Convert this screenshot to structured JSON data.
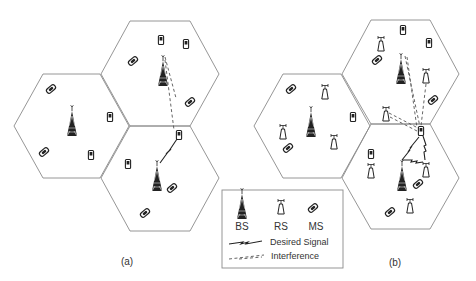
{
  "figure": {
    "panels": [
      {
        "id": "a",
        "label": "(a)",
        "description": "Conventional cellular network: base stations and mobile stations"
      },
      {
        "id": "b",
        "label": "(b)",
        "description": "Relay-assisted cellular network: base stations, relay stations and mobile stations"
      }
    ],
    "legend": {
      "bs_label": "BS",
      "rs_label": "RS",
      "ms_label": "MS",
      "desired_signal_label": "Desired Signal",
      "interference_label": "Interference"
    },
    "icons": {
      "bs": "cell-tower-icon",
      "rs": "relay-station-icon",
      "ms": "mobile-phone-icon"
    },
    "colors": {
      "hex_stroke": "#8a8a8a",
      "icon": "#222222",
      "text": "#333333"
    }
  }
}
